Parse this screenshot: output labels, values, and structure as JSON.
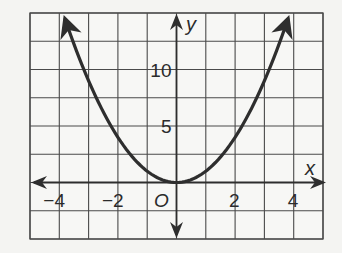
{
  "chart_data": {
    "type": "line",
    "title": "",
    "function": "y = x^2",
    "xlabel": "x",
    "ylabel": "y",
    "origin_label": "O",
    "xlim": [
      -5,
      5
    ],
    "ylim": [
      -5,
      15
    ],
    "x_grid_step": 1,
    "y_grid_step": 2.5,
    "grid": true,
    "x_ticks": [
      {
        "value": -4,
        "label": "−4"
      },
      {
        "value": -2,
        "label": "−2"
      },
      {
        "value": 2,
        "label": "2"
      },
      {
        "value": 4,
        "label": "4"
      }
    ],
    "y_ticks": [
      {
        "value": 5,
        "label": "5"
      },
      {
        "value": 10,
        "label": "10"
      }
    ],
    "series": [
      {
        "name": "y = x^2",
        "x": [
          -3.8,
          -3,
          -2,
          -1,
          0,
          1,
          2,
          3,
          3.8
        ],
        "y": [
          14.44,
          9,
          4,
          1,
          0,
          1,
          4,
          9,
          14.44
        ],
        "arrows_at_ends": true
      }
    ],
    "colors": {
      "curve": "#2e2e2e",
      "grid": "#4a4a4a",
      "axes": "#2e2e2e",
      "background": "#f4f4f2"
    }
  }
}
